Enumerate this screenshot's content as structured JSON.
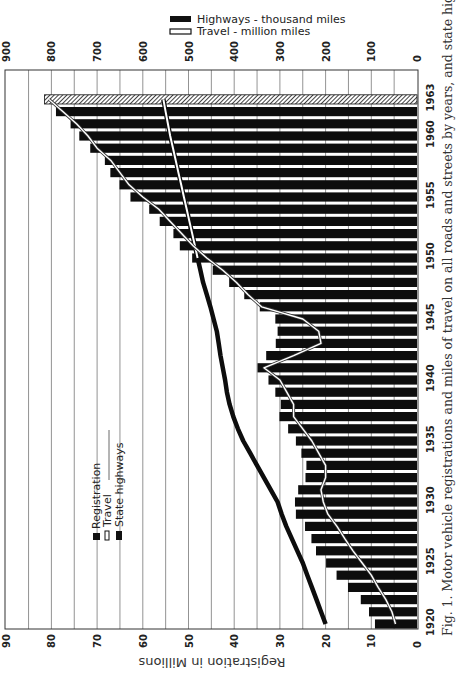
{
  "figure": {
    "caption": "Fig. 1.  Motor vehicle registrations and miles of travel on all roads and streets by years, and state highway mileage.",
    "bottom_axis_title": "Registration in Millions",
    "top_legend": [
      {
        "label": "Highways - thousand miles",
        "style": "solid",
        "color": "#111111"
      },
      {
        "label": "Travel - million miles",
        "style": "hollow",
        "color": "#ffffff"
      }
    ],
    "inner_legend": [
      {
        "label": "Registration",
        "style": "solid-box"
      },
      {
        "label": "Travel",
        "style": "hollow-box"
      },
      {
        "label": "State highways",
        "style": "thick-solid-box"
      }
    ],
    "orientation": "rotated 90° clockwise (years run upward along right edge)"
  },
  "chart_data": {
    "type": "bar",
    "title": "Motor vehicle registrations and miles of travel on all roads and streets by years, and state highway mileage",
    "xlabel": "Year",
    "ylabel": "Registration in Millions",
    "ylabel_secondary": "Highways - thousand miles / Travel - million miles",
    "ylim": [
      0,
      90
    ],
    "ylim_secondary": [
      0,
      900
    ],
    "grid": true,
    "y_ticks": [
      0,
      10,
      20,
      30,
      40,
      50,
      60,
      70,
      80,
      90
    ],
    "y_ticks_secondary": [
      0,
      100,
      200,
      300,
      400,
      500,
      600,
      700,
      800,
      900
    ],
    "x_tick_labels": [
      "1920",
      "1925",
      "1930",
      "1935",
      "1940",
      "1945",
      "1950",
      "1955",
      "1960",
      "1963"
    ],
    "categories": [
      1920,
      1921,
      1922,
      1923,
      1924,
      1925,
      1926,
      1927,
      1928,
      1929,
      1930,
      1931,
      1932,
      1933,
      1934,
      1935,
      1936,
      1937,
      1938,
      1939,
      1940,
      1941,
      1942,
      1943,
      1944,
      1945,
      1946,
      1947,
      1948,
      1949,
      1950,
      1951,
      1952,
      1953,
      1954,
      1955,
      1956,
      1957,
      1958,
      1959,
      1960,
      1961,
      1962,
      1963
    ],
    "series": [
      {
        "name": "Registration",
        "type": "bar",
        "axis": "bottom (millions)",
        "values": [
          9.2,
          10.5,
          12.3,
          15.1,
          17.6,
          19.9,
          22.1,
          23.1,
          24.5,
          26.5,
          26.7,
          26.0,
          24.4,
          24.2,
          25.3,
          26.5,
          28.2,
          30.1,
          29.8,
          31.0,
          32.5,
          34.9,
          33.0,
          30.9,
          30.5,
          31.0,
          34.4,
          37.8,
          41.1,
          44.7,
          49.2,
          51.9,
          53.3,
          56.3,
          58.6,
          62.7,
          65.1,
          67.1,
          68.3,
          71.5,
          73.9,
          75.8,
          79.0,
          81.5
        ],
        "note": "1963 bar hatched (estimate)"
      },
      {
        "name": "Travel",
        "type": "line",
        "style": "hollow",
        "axis": "top (million miles)",
        "values": [
          47,
          55,
          68,
          85,
          100,
          120,
          140,
          158,
          175,
          195,
          205,
          210,
          200,
          200,
          215,
          230,
          250,
          270,
          270,
          285,
          300,
          335,
          270,
          210,
          215,
          250,
          340,
          370,
          395,
          425,
          460,
          490,
          515,
          540,
          565,
          600,
          630,
          650,
          670,
          700,
          720,
          745,
          775,
          805
        ]
      },
      {
        "name": "State highways",
        "type": "line",
        "style": "thick-solid",
        "axis": "top (thousand miles)",
        "values": [
          200,
          210,
          220,
          230,
          240,
          250,
          262,
          274,
          286,
          296,
          305,
          320,
          335,
          350,
          365,
          380,
          392,
          402,
          410,
          416,
          420,
          425,
          430,
          434,
          438,
          445,
          452,
          460,
          468,
          474,
          480,
          486,
          492,
          498,
          504,
          510,
          516,
          522,
          528,
          534,
          540,
          545,
          550,
          555
        ]
      }
    ]
  }
}
